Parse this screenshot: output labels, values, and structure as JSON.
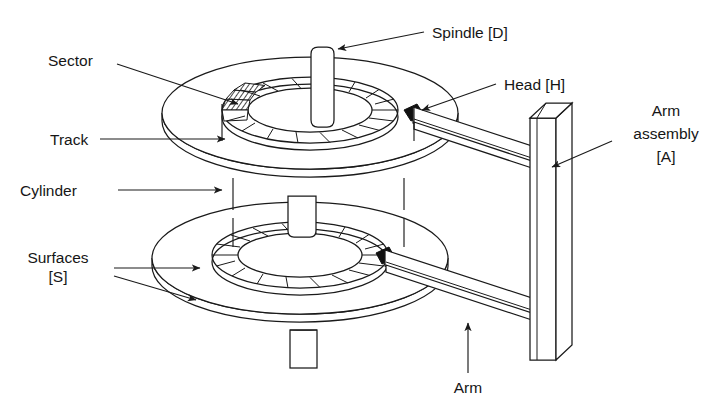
{
  "figure": {
    "background_color": "#ffffff",
    "line_color": "#1a1a1a",
    "text_color": "#161616"
  },
  "labels": {
    "sector": "Sector",
    "track": "Track",
    "cylinder": "Cylinder",
    "surfaces_line1": "Surfaces",
    "surfaces_line2": "[S]",
    "spindle": "Spindle [D]",
    "head": "Head [H]",
    "arm_assembly_line1": "Arm",
    "arm_assembly_line2": "assembly",
    "arm_assembly_line3": "[A]",
    "arm": "Arm"
  },
  "components": {
    "platter_top": "upper-disk-platter",
    "platter_bottom": "lower-disk-platter",
    "spindle_shaft": "spindle-shaft",
    "spindle_stub": "spindle-bottom-stub",
    "head_top": "read-write-head-top",
    "head_bottom": "read-write-head-bottom",
    "arm_top": "actuator-arm-top",
    "arm_bottom": "actuator-arm-bottom",
    "arm_assembly_column": "actuator-arm-assembly-column",
    "sector_hatch": "highlighted-sector-wedge",
    "cylinder_marks": "cylinder-alignment-ticks"
  }
}
